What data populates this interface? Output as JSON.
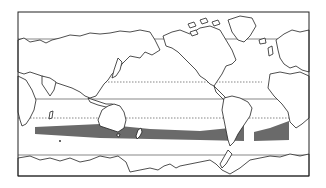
{
  "map": {
    "title": "World map with southern hemisphere shaded band",
    "projection": "Pacific-centered equirectangular world outline",
    "colors": {
      "background": "#ffffff",
      "outline": "#222222",
      "band_fill": "#6a6a6a",
      "latitude_solid": "#555555",
      "latitude_dotted": "#555555"
    },
    "frame": {
      "x": 18,
      "y": 12,
      "width": 291,
      "height": 164
    },
    "latitude_lines": [
      {
        "name": "tropic-of-cancer",
        "style": "dotted",
        "y": 82
      },
      {
        "name": "equator",
        "style": "solid",
        "y": 99
      },
      {
        "name": "tropic-of-capricorn",
        "style": "dotted",
        "y": 118
      },
      {
        "name": "antarctic-circle",
        "style": "solid",
        "y": 155
      },
      {
        "name": "arctic-circle",
        "style": "solid",
        "y": 39
      }
    ],
    "shaded_band": {
      "description": "Dark shaded zone across southern mid-latitudes",
      "x_start": 35,
      "x_end": 289,
      "top_y": 127,
      "bottom_y": 139
    },
    "regions_visible": [
      "Europe",
      "Asia",
      "Africa",
      "Australia",
      "New Zealand",
      "North America",
      "South America",
      "Greenland",
      "Antarctica"
    ]
  }
}
